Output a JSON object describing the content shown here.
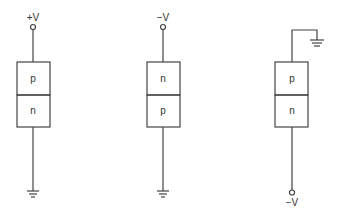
{
  "diagram": {
    "stroke_color": "#444444",
    "devices": [
      {
        "id": "left",
        "top_label": "+V",
        "regions": [
          "p",
          "n"
        ],
        "bottom": "ground"
      },
      {
        "id": "middle",
        "top_label": "−V",
        "regions": [
          "n",
          "p"
        ],
        "bottom": "ground"
      },
      {
        "id": "right",
        "top": "ground",
        "regions": [
          "p",
          "n"
        ],
        "bottom_label": "−V"
      }
    ]
  }
}
